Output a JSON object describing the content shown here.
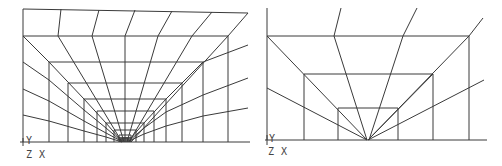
{
  "figures": [
    {
      "id": "left-mesh",
      "description": "Graded quadrilateral mesh refined toward bottom-center focal point",
      "axis_labels": {
        "y": "Y",
        "z": "Z",
        "x": "X"
      }
    },
    {
      "id": "right-mesh",
      "description": "Coarse quadrilateral mesh with radial lines converging at bottom-center focal point",
      "axis_labels": {
        "y": "Y",
        "z": "Z",
        "x": "X"
      }
    }
  ],
  "colors": {
    "line": "#3a3a3a",
    "background": "#ffffff",
    "label": "#444444"
  }
}
